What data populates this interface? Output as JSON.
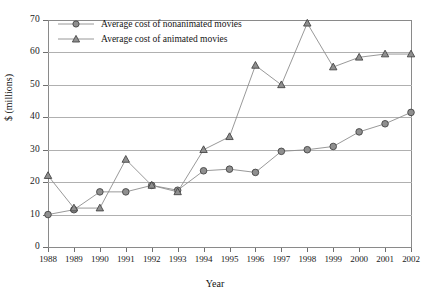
{
  "chart_data": {
    "type": "line",
    "title": "",
    "xlabel": "Year",
    "ylabel": "$ (millions)",
    "xlim": [
      1988,
      2002
    ],
    "ylim": [
      0,
      70
    ],
    "ytick_step": 10,
    "grid": true,
    "legend_position": "top-left-inside",
    "categories": [
      1988,
      1989,
      1990,
      1991,
      1992,
      1993,
      1994,
      1995,
      1996,
      1997,
      1998,
      1999,
      2000,
      2001,
      2002
    ],
    "xtick_labels": [
      "1988",
      "1989",
      "1990",
      "1991",
      "1992",
      "1993",
      "1994",
      "1995",
      "1996",
      "1997",
      "1998",
      "1999",
      "2000",
      "2001",
      "2002"
    ],
    "ytick_labels": [
      "0",
      "10",
      "20",
      "30",
      "40",
      "50",
      "60",
      "70"
    ],
    "ytick_values": [
      0,
      10,
      20,
      30,
      40,
      50,
      60,
      70
    ],
    "series": [
      {
        "name": "Average cost of nonanimated movies",
        "marker": "circle",
        "color": "#8f8f8f",
        "values": [
          10,
          11.5,
          17,
          17,
          19,
          17.5,
          23.5,
          24,
          23,
          29.5,
          30,
          31,
          35.5,
          38,
          41.5
        ]
      },
      {
        "name": "Average cost of animated movies",
        "marker": "triangle",
        "color": "#8f8f8f",
        "values": [
          22,
          12,
          12,
          27,
          19,
          17,
          30,
          34,
          56,
          50,
          69,
          55.5,
          58.5,
          59.5,
          59.5
        ]
      }
    ]
  },
  "legend": {
    "items": [
      {
        "label": "Average cost of nonanimated movies",
        "marker": "circle"
      },
      {
        "label": "Average cost of animated movies",
        "marker": "triangle"
      }
    ]
  }
}
